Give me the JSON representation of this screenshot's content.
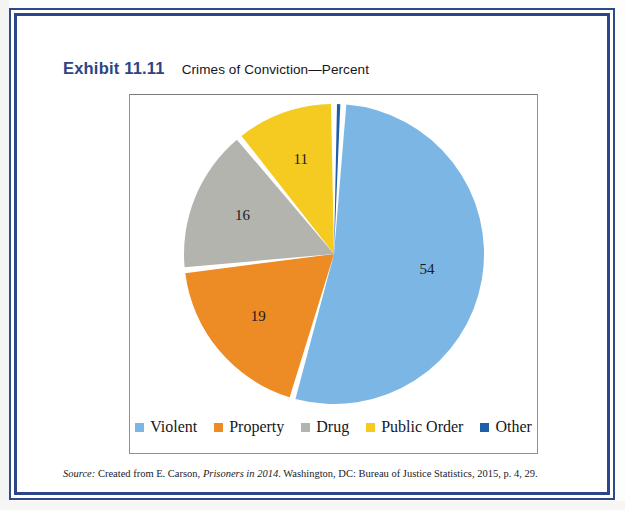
{
  "exhibit": {
    "label": "Exhibit 11.11",
    "caption": "Crimes of Conviction—Percent"
  },
  "source": {
    "prefix": "Source:",
    "text_before_title": " Created from E. Carson, ",
    "title": "Prisoners in 2014",
    "text_after_title": ". Washington, DC: Bureau of Justice Statistics, 2015, p. 4, 29."
  },
  "legend": {
    "position": "bottom",
    "items": [
      {
        "label": "Violent",
        "color": "#7cb6e4"
      },
      {
        "label": "Property",
        "color": "#ed8b24"
      },
      {
        "label": "Drug",
        "color": "#b4b4ae"
      },
      {
        "label": "Public Order",
        "color": "#f5cb21"
      },
      {
        "label": "Other",
        "color": "#1f5ea8"
      }
    ]
  },
  "chart_data": {
    "type": "pie",
    "title": "Crimes of Conviction—Percent",
    "xlabel": "",
    "ylabel": "",
    "categories": [
      "Other",
      "Violent",
      "Property",
      "Drug",
      "Public Order"
    ],
    "values": [
      1,
      54,
      19,
      16,
      11
    ],
    "data_labels": [
      "1",
      "54",
      "19",
      "16",
      "11"
    ],
    "colors": [
      "#1f5ea8",
      "#7cb6e4",
      "#ed8b24",
      "#b4b4ae",
      "#f5cb21"
    ],
    "units": "percent",
    "start_angle_deg": 0,
    "direction": "clockwise",
    "slice_gap": true,
    "legend_position": "bottom",
    "grid": false,
    "slices": [
      {
        "name": "Other",
        "value": 1,
        "label": "1",
        "color": "#1f5ea8"
      },
      {
        "name": "Violent",
        "value": 54,
        "label": "54",
        "color": "#7cb6e4"
      },
      {
        "name": "Property",
        "value": 19,
        "label": "19",
        "color": "#ed8b24"
      },
      {
        "name": "Drug",
        "value": 16,
        "label": "16",
        "color": "#b4b4ae"
      },
      {
        "name": "Public Order",
        "value": 11,
        "label": "11",
        "color": "#f5cb21"
      }
    ]
  }
}
